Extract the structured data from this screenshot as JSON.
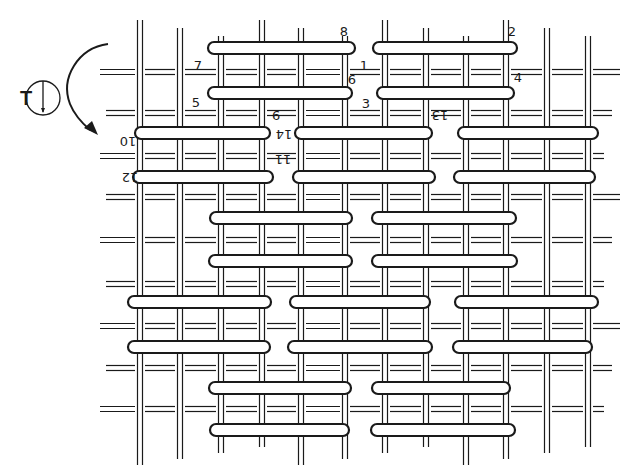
{
  "diagram": {
    "title_symbol": "T",
    "stroke_color": "#1a1a1a",
    "background": "#ffffff",
    "vertical_threads_x": [
      140,
      180,
      221,
      262,
      301,
      345,
      385,
      426,
      466,
      506,
      547,
      588
    ],
    "vertical_threads_range": [
      20,
      465
    ],
    "horizontal_threads_y": [
      72,
      113,
      156,
      197,
      240,
      284,
      326,
      368,
      409
    ],
    "horizontal_threads_range": [
      100,
      620
    ],
    "floats": [
      {
        "row": 1,
        "y": 48,
        "segments": [
          [
            208,
            355
          ],
          [
            373,
            517
          ]
        ]
      },
      {
        "row": 2,
        "y": 93,
        "segments": [
          [
            208,
            352
          ],
          [
            377,
            514
          ]
        ]
      },
      {
        "row": 3,
        "y": 133,
        "segments": [
          [
            135,
            270
          ],
          [
            295,
            432
          ],
          [
            458,
            598
          ]
        ]
      },
      {
        "row": 4,
        "y": 177,
        "segments": [
          [
            133,
            273
          ],
          [
            293,
            435
          ],
          [
            454,
            595
          ]
        ]
      },
      {
        "row": 5,
        "y": 218,
        "segments": [
          [
            210,
            352
          ],
          [
            372,
            516
          ]
        ]
      },
      {
        "row": 6,
        "y": 261,
        "segments": [
          [
            209,
            352
          ],
          [
            372,
            517
          ]
        ]
      },
      {
        "row": 7,
        "y": 302,
        "segments": [
          [
            128,
            271
          ],
          [
            290,
            430
          ],
          [
            455,
            598
          ]
        ]
      },
      {
        "row": 8,
        "y": 347,
        "segments": [
          [
            128,
            270
          ],
          [
            288,
            432
          ],
          [
            453,
            592
          ]
        ]
      },
      {
        "row": 9,
        "y": 388,
        "segments": [
          [
            209,
            351
          ],
          [
            372,
            510
          ]
        ]
      },
      {
        "row": 10,
        "y": 430,
        "segments": [
          [
            210,
            349
          ],
          [
            371,
            515
          ]
        ]
      }
    ],
    "labels": [
      {
        "text": "8",
        "x": 344,
        "y": 36,
        "rotated": false
      },
      {
        "text": "2",
        "x": 512,
        "y": 36,
        "rotated": false
      },
      {
        "text": "7",
        "x": 198,
        "y": 70,
        "rotated": false
      },
      {
        "text": "1",
        "x": 364,
        "y": 70,
        "rotated": false
      },
      {
        "text": "6",
        "x": 352,
        "y": 84,
        "rotated": false
      },
      {
        "text": "4",
        "x": 518,
        "y": 82,
        "rotated": false
      },
      {
        "text": "5",
        "x": 196,
        "y": 107,
        "rotated": false
      },
      {
        "text": "3",
        "x": 366,
        "y": 108,
        "rotated": false
      },
      {
        "text": "9",
        "x": 276,
        "y": 121,
        "rotated": true
      },
      {
        "text": "13",
        "x": 440,
        "y": 121,
        "rotated": true
      },
      {
        "text": "14",
        "x": 284,
        "y": 140,
        "rotated": true
      },
      {
        "text": "10",
        "x": 128,
        "y": 147,
        "rotated": true
      },
      {
        "text": "11",
        "x": 283,
        "y": 165,
        "rotated": true
      },
      {
        "text": "12",
        "x": 130,
        "y": 183,
        "rotated": true
      }
    ],
    "orientation_marker": {
      "letter": "T",
      "circle_icon": "circle-with-down-arrow",
      "arrow_icon": "curved-rotation-arrow"
    }
  }
}
